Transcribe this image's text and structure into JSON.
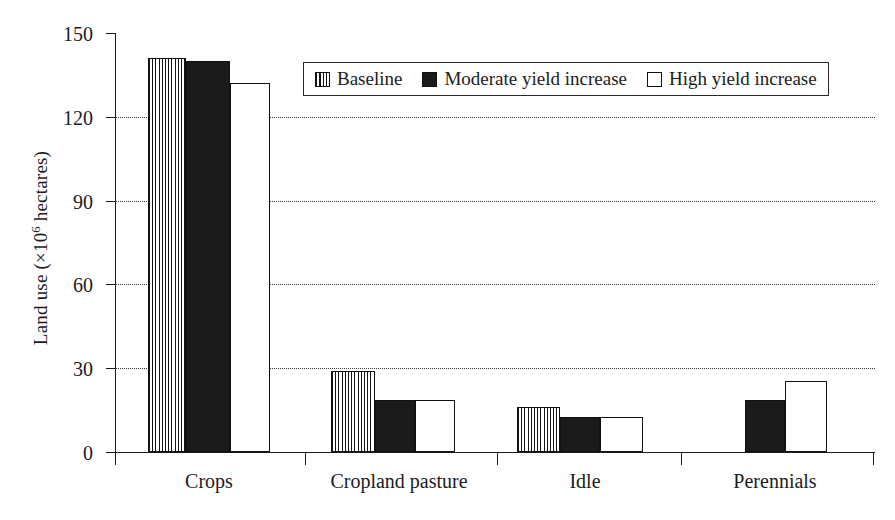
{
  "chart_data": {
    "type": "bar",
    "title": "",
    "xlabel": "",
    "ylabel": "Land use (×10⁶ hectares)",
    "ylabel_prefix": "Land use (×10",
    "ylabel_exponent": "6",
    "ylabel_suffix": " hectares)",
    "categories": [
      "Crops",
      "Cropland pasture",
      "Idle",
      "Perennials"
    ],
    "series": [
      {
        "name": "Baseline",
        "values": [
          141,
          29,
          16,
          null
        ]
      },
      {
        "name": "Moderate yield increase",
        "values": [
          140,
          18.5,
          12.5,
          18.5
        ]
      },
      {
        "name": "High yield increase",
        "values": [
          132,
          18.5,
          12.5,
          25.5
        ]
      }
    ],
    "ylim": [
      0,
      150
    ],
    "yticks": [
      0,
      30,
      60,
      90,
      120,
      150
    ],
    "ytick_labels": [
      "0",
      "30",
      "60",
      "90",
      "120",
      "150"
    ],
    "grid": "horizontal-dotted-at-30-60-90-120",
    "legend_position": "top-center",
    "colors": {
      "baseline": "#ffffff",
      "baseline_hatch": "#131313",
      "moderate": "#1b1b1b",
      "high": "#ffffff",
      "axis": "#1a1a1a",
      "grid": "#3a3a3a",
      "text": "#1c1c1c"
    }
  },
  "legend": {
    "items": [
      {
        "label": "Baseline",
        "swatch": "hatched-vertical-swatch"
      },
      {
        "label": "Moderate yield increase",
        "swatch": "solid-black-swatch"
      },
      {
        "label": "High yield increase",
        "swatch": "empty-white-swatch"
      }
    ]
  }
}
